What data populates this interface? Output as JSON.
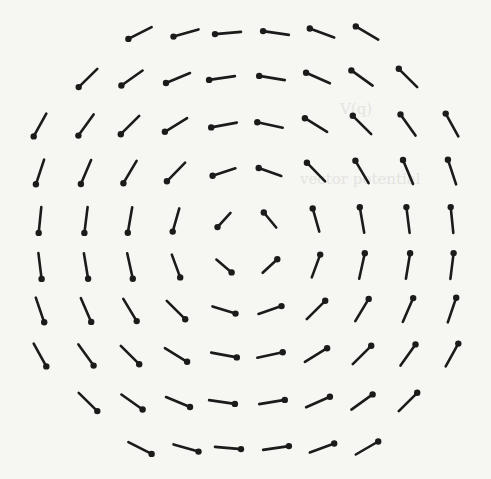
{
  "figure": {
    "type": "vector-field",
    "center": [
      246,
      240
    ],
    "background_color": "#f6f6f3",
    "arrow_color": "#1b1b1b",
    "head_radius": 3.2,
    "stroke_width": 2.6
  },
  "ghost_text": [
    {
      "text": "V(q)",
      "x": 340,
      "y": 100
    },
    {
      "text": "vector potential",
      "x": 300,
      "y": 170
    }
  ],
  "rows": [
    {
      "y": 33,
      "xs": [
        140,
        186,
        228,
        276,
        322,
        367
      ]
    },
    {
      "y": 78,
      "xs": [
        88,
        132,
        178,
        222,
        272,
        318,
        362,
        408
      ]
    },
    {
      "y": 125,
      "xs": [
        40,
        86,
        130,
        176,
        224,
        270,
        316,
        362,
        408,
        452
      ]
    },
    {
      "y": 172,
      "xs": [
        40,
        86,
        130,
        176,
        224,
        270,
        316,
        362,
        408,
        452
      ]
    },
    {
      "y": 220,
      "xs": [
        40,
        86,
        130,
        176,
        224,
        270,
        316,
        362,
        408,
        452
      ]
    },
    {
      "y": 266,
      "xs": [
        40,
        86,
        130,
        176,
        224,
        270,
        316,
        362,
        408,
        452
      ]
    },
    {
      "y": 310,
      "xs": [
        40,
        86,
        130,
        176,
        224,
        270,
        316,
        362,
        408,
        452
      ]
    },
    {
      "y": 355,
      "xs": [
        40,
        86,
        130,
        176,
        224,
        270,
        316,
        362,
        408,
        452
      ]
    },
    {
      "y": 402,
      "xs": [
        88,
        132,
        178,
        222,
        272,
        318,
        362,
        408
      ]
    },
    {
      "y": 448,
      "xs": [
        140,
        186,
        228,
        276,
        322,
        367
      ]
    }
  ],
  "arrow_length": {
    "max": 26,
    "min": 16
  }
}
